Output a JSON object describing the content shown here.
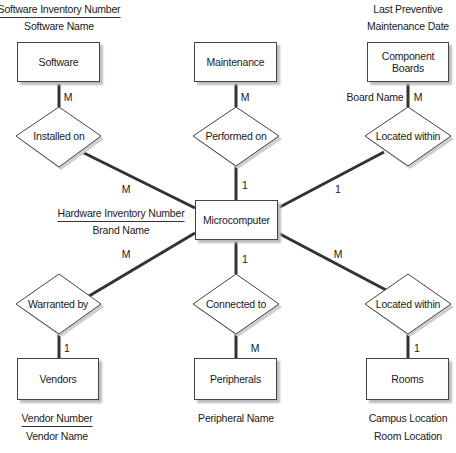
{
  "entities": {
    "software": {
      "label": "Software",
      "attributes": {
        "key": "Software Inventory Number",
        "other": [
          "Software Name"
        ]
      }
    },
    "maintenance": {
      "label": "Maintenance"
    },
    "component_boards": {
      "label": "Component Boards",
      "attributes": {
        "above": [
          "Last Preventive",
          "Maintenance Date"
        ],
        "side": "Board Name"
      }
    },
    "microcomputer": {
      "label": "Microcomputer",
      "attributes": {
        "key": "Hardware Inventory Number",
        "other": [
          "Brand Name"
        ]
      }
    },
    "vendors": {
      "label": "Vendors",
      "attributes": {
        "key": "Vendor Number",
        "other": [
          "Vendor Name"
        ]
      }
    },
    "peripherals": {
      "label": "Peripherals",
      "attributes": {
        "other": [
          "Peripheral Name"
        ]
      }
    },
    "rooms": {
      "label": "Rooms",
      "attributes": {
        "other": [
          "Campus Location",
          "Room Location"
        ]
      }
    }
  },
  "relationships": {
    "installed_on": {
      "label": "Installed on",
      "card_entity": "M",
      "card_micro": "M"
    },
    "performed_on": {
      "label": "Performed on",
      "card_entity": "M",
      "card_micro": "1"
    },
    "located_within_boards": {
      "label": "Located within",
      "card_entity": "M",
      "card_micro": "1"
    },
    "warranted_by": {
      "label": "Warranted by",
      "card_entity": "1",
      "card_micro": "M"
    },
    "connected_to": {
      "label": "Connected to",
      "card_entity": "M",
      "card_micro": "1"
    },
    "located_within_rooms": {
      "label": "Located within",
      "card_entity": "1",
      "card_micro": "M"
    }
  },
  "colors": {
    "line": "#333333",
    "border": "#444444",
    "shadow": "#bdbdbd"
  }
}
